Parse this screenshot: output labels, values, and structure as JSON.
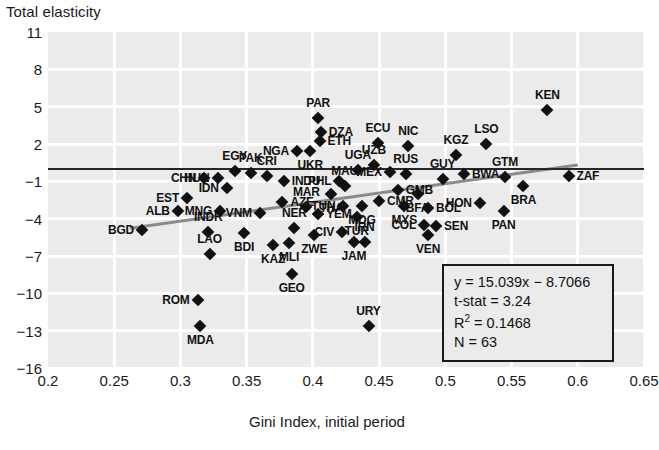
{
  "chart_data": {
    "type": "scatter",
    "title": "",
    "ylabel": "Total elasticity",
    "xlabel": "Gini Index, initial period",
    "xlim": [
      0.2,
      0.65
    ],
    "ylim": [
      -16,
      11
    ],
    "xticks": [
      "0.2",
      "0.25",
      "0.3",
      "0.35",
      "0.4",
      "0.45",
      "0.5",
      "0.55",
      "0.6",
      "0.65"
    ],
    "xtick_values": [
      0.2,
      0.25,
      0.3,
      0.35,
      0.4,
      0.45,
      0.5,
      0.55,
      0.6,
      0.65
    ],
    "yticks": [
      "11",
      "8",
      "5",
      "2",
      "−1",
      "−4",
      "−7",
      "−10",
      "−13",
      "−16"
    ],
    "ytick_values": [
      11,
      8,
      5,
      2,
      -1,
      -4,
      -7,
      -10,
      -13,
      -16
    ],
    "grid": true,
    "zero_line": true,
    "regression_line": {
      "slope": 15.039,
      "intercept": -8.7066
    },
    "marker": "diamond",
    "marker_color": "#111111",
    "plot_background": "#ebebeb",
    "gridline_color": "#ffffff",
    "n_points": 63,
    "points": [
      {
        "label": "BGD",
        "x": 0.271,
        "y": -4.95,
        "lp": "left"
      },
      {
        "label": "ALB",
        "x": 0.298,
        "y": -3.35,
        "lp": "left"
      },
      {
        "label": "EST",
        "x": 0.305,
        "y": -2.3,
        "lp": "left"
      },
      {
        "label": "CHN",
        "x": 0.318,
        "y": -0.75,
        "lp": "left"
      },
      {
        "label": "HUN",
        "x": 0.328,
        "y": -0.7,
        "lp": "left"
      },
      {
        "label": "MNG",
        "x": 0.33,
        "y": -3.4,
        "lp": "left"
      },
      {
        "label": "INDR",
        "x": 0.321,
        "y": -5.05,
        "lp": "top"
      },
      {
        "label": "IDN",
        "x": 0.335,
        "y": -1.55,
        "lp": "left"
      },
      {
        "label": "LAO",
        "x": 0.322,
        "y": -6.85,
        "lp": "top"
      },
      {
        "label": "ROM",
        "x": 0.313,
        "y": -10.55,
        "lp": "left"
      },
      {
        "label": "MDA",
        "x": 0.315,
        "y": -12.6,
        "lp": "bottom"
      },
      {
        "label": "BDI",
        "x": 0.348,
        "y": -5.15,
        "lp": "bottom"
      },
      {
        "label": "EGY",
        "x": 0.341,
        "y": -0.2,
        "lp": "top"
      },
      {
        "label": "PAK",
        "x": 0.353,
        "y": -0.3,
        "lp": "top"
      },
      {
        "label": "CRI",
        "x": 0.365,
        "y": -0.55,
        "lp": "top"
      },
      {
        "label": "VNM",
        "x": 0.36,
        "y": -3.55,
        "lp": "left"
      },
      {
        "label": "KAZ",
        "x": 0.37,
        "y": -6.15,
        "lp": "bottom"
      },
      {
        "label": "INDU",
        "x": 0.378,
        "y": -0.95,
        "lp": "right"
      },
      {
        "label": "AZE",
        "x": 0.377,
        "y": -2.7,
        "lp": "right"
      },
      {
        "label": "MLI",
        "x": 0.382,
        "y": -5.95,
        "lp": "bottom"
      },
      {
        "label": "GEO",
        "x": 0.384,
        "y": -8.45,
        "lp": "bottom"
      },
      {
        "label": "NER",
        "x": 0.386,
        "y": -4.75,
        "lp": "top"
      },
      {
        "label": "MAR",
        "x": 0.395,
        "y": -3.05,
        "lp": "top"
      },
      {
        "label": "NGA",
        "x": 0.388,
        "y": 1.45,
        "lp": "left"
      },
      {
        "label": "PAR",
        "x": 0.404,
        "y": 4.1,
        "lp": "top"
      },
      {
        "label": "DZA",
        "x": 0.406,
        "y": 2.95,
        "lp": "right"
      },
      {
        "label": "ETH",
        "x": 0.405,
        "y": 2.25,
        "lp": "right"
      },
      {
        "label": "UKR",
        "x": 0.398,
        "y": 1.4,
        "lp": "bottom"
      },
      {
        "label": "YEM",
        "x": 0.404,
        "y": -3.6,
        "lp": "right"
      },
      {
        "label": "ZWE",
        "x": 0.401,
        "y": -5.35,
        "lp": "bottom"
      },
      {
        "label": "THA",
        "x": 0.414,
        "y": -2.05,
        "lp": "bottom"
      },
      {
        "label": "PHL",
        "x": 0.42,
        "y": -1.0,
        "lp": "left"
      },
      {
        "label": "MAU",
        "x": 0.424,
        "y": -1.35,
        "lp": "top"
      },
      {
        "label": "TUN",
        "x": 0.423,
        "y": -2.95,
        "lp": "left"
      },
      {
        "label": "CIV",
        "x": 0.422,
        "y": -5.05,
        "lp": "left"
      },
      {
        "label": "JAM",
        "x": 0.431,
        "y": -5.85,
        "lp": "bottom"
      },
      {
        "label": "UGA",
        "x": 0.434,
        "y": -0.1,
        "lp": "top"
      },
      {
        "label": "MDG",
        "x": 0.437,
        "y": -3.0,
        "lp": "bottom"
      },
      {
        "label": "TUR",
        "x": 0.433,
        "y": -3.9,
        "lp": "bottom"
      },
      {
        "label": "IRN",
        "x": 0.439,
        "y": -5.9,
        "lp": "top"
      },
      {
        "label": "URY",
        "x": 0.442,
        "y": -12.65,
        "lp": "top"
      },
      {
        "label": "UZB",
        "x": 0.446,
        "y": 0.3,
        "lp": "top"
      },
      {
        "label": "ECU",
        "x": 0.449,
        "y": 2.05,
        "lp": "top"
      },
      {
        "label": "CMR",
        "x": 0.45,
        "y": -2.55,
        "lp": "right"
      },
      {
        "label": "MEX",
        "x": 0.458,
        "y": -0.25,
        "lp": "left"
      },
      {
        "label": "GMB",
        "x": 0.464,
        "y": -1.7,
        "lp": "right"
      },
      {
        "label": "RUS",
        "x": 0.47,
        "y": -0.45,
        "lp": "top"
      },
      {
        "label": "NIC",
        "x": 0.472,
        "y": 1.85,
        "lp": "top"
      },
      {
        "label": "MYS",
        "x": 0.469,
        "y": -3.0,
        "lp": "bottom"
      },
      {
        "label": "BFA",
        "x": 0.479,
        "y": -2.0,
        "lp": "bottom"
      },
      {
        "label": "COL",
        "x": 0.484,
        "y": -4.5,
        "lp": "left"
      },
      {
        "label": "VEN",
        "x": 0.487,
        "y": -5.35,
        "lp": "bottom"
      },
      {
        "label": "SEN",
        "x": 0.493,
        "y": -4.55,
        "lp": "right"
      },
      {
        "label": "BOL",
        "x": 0.487,
        "y": -3.15,
        "lp": "right"
      },
      {
        "label": "GUY",
        "x": 0.498,
        "y": -0.85,
        "lp": "top"
      },
      {
        "label": "KGZ",
        "x": 0.508,
        "y": 1.1,
        "lp": "top"
      },
      {
        "label": "BWA",
        "x": 0.514,
        "y": -0.4,
        "lp": "right"
      },
      {
        "label": "HON",
        "x": 0.526,
        "y": -2.75,
        "lp": "left"
      },
      {
        "label": "LSO",
        "x": 0.531,
        "y": 2.0,
        "lp": "top"
      },
      {
        "label": "GTM",
        "x": 0.545,
        "y": -0.65,
        "lp": "top"
      },
      {
        "label": "PAN",
        "x": 0.544,
        "y": -3.35,
        "lp": "bottom"
      },
      {
        "label": "BRA",
        "x": 0.559,
        "y": -1.35,
        "lp": "bottom"
      },
      {
        "label": "KEN",
        "x": 0.577,
        "y": 4.75,
        "lp": "top"
      },
      {
        "label": "ZAF",
        "x": 0.593,
        "y": -0.55,
        "lp": "right"
      }
    ]
  },
  "stats_box": {
    "equation": "y = 15.039x − 8.7066",
    "tstat": "t-stat = 3.24",
    "r2_prefix": "R",
    "r2_sup": "2",
    "r2_value": " = 0.1468",
    "n": "N = 63"
  }
}
